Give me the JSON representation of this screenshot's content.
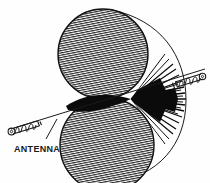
{
  "figure": {
    "background_color": "#fefefe",
    "ink_color": "#111111",
    "hatch_color": "#2b2b2b",
    "lobe_fill": "#b8b8b8"
  },
  "labels": {
    "antenna": "ANTENNA"
  },
  "elements": {
    "upper_lobe": "upper-radiation-lobe",
    "lower_lobe": "lower-radiation-lobe",
    "outer_envelope": "outer-pattern-envelope",
    "fan_rays": "radial-ray-fan",
    "waist": "pattern-null-waist",
    "antenna_axis": "antenna-axis-line",
    "coil_left": "helical-antenna-element-left",
    "coil_right": "helical-antenna-element-right",
    "leader": "antenna-label-leader-line"
  },
  "geometry": {
    "upper_lobe_center": [
      103,
      54
    ],
    "upper_lobe_radius": 45,
    "lower_lobe_center": [
      107,
      145
    ],
    "lower_lobe_radius": 47,
    "fan_origin": [
      131,
      99
    ],
    "fan_ray_count": 34,
    "fan_spread_degrees": 150,
    "hatch_angle_degrees": -11,
    "hatch_spacing_px": 2.2,
    "antenna_axis_start": [
      14,
      128
    ],
    "antenna_axis_end": [
      205,
      69
    ]
  }
}
